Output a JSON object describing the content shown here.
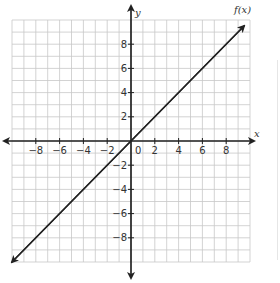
{
  "chart_data": {
    "type": "line",
    "title": "",
    "function_label": "f(x)",
    "xlabel": "x",
    "ylabel": "y",
    "xlim": [
      -10,
      10
    ],
    "ylim": [
      -10,
      10
    ],
    "grid": true,
    "grid_step": 1,
    "x_ticks": [
      -8,
      -6,
      -4,
      -2,
      0,
      2,
      4,
      6,
      8
    ],
    "x_tick_labels": [
      "−8",
      "−6",
      "−4",
      "−2",
      "0",
      "2",
      "4",
      "6",
      "8"
    ],
    "y_ticks": [
      8,
      6,
      4,
      2,
      -2,
      -4,
      -6,
      -8
    ],
    "y_tick_labels": [
      "8",
      "6",
      "4",
      "2",
      "−2",
      "−4",
      "−6",
      "−8"
    ],
    "series": [
      {
        "name": "f(x)",
        "equation": "f(x) = x",
        "x": [
          -10,
          -8,
          -6,
          -4,
          -2,
          0,
          2,
          4,
          6,
          8,
          9.5
        ],
        "y": [
          -10,
          -8,
          -6,
          -4,
          -2,
          0,
          2,
          4,
          6,
          8,
          9.5
        ],
        "arrows_both_ends": true
      }
    ]
  },
  "colors": {
    "grid": "#c8c8c8",
    "axis": "#222222",
    "line": "#222222",
    "text": "#333333"
  }
}
